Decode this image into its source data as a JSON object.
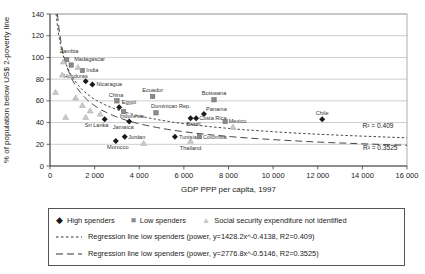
{
  "figure": {
    "background": "#ffffff"
  },
  "chart_data": {
    "type": "scatter",
    "title": "",
    "xlabel": "GDP PPP per capita, 1997",
    "ylabel": "% of population below US$ 2-poverty line",
    "xlim": [
      0,
      16000
    ],
    "ylim": [
      0,
      140
    ],
    "grid": "horizontal",
    "legend_position": "bottom-box",
    "xticks": [
      {
        "value": 0,
        "label": "0"
      },
      {
        "value": 2000,
        "label": "2 000"
      },
      {
        "value": 4000,
        "label": "4 000"
      },
      {
        "value": 6000,
        "label": "6 000"
      },
      {
        "value": 8000,
        "label": "8 000"
      },
      {
        "value": 10000,
        "label": "10 000"
      },
      {
        "value": 12000,
        "label": "12 000"
      },
      {
        "value": 14000,
        "label": "14 000"
      },
      {
        "value": 16000,
        "label": "16 000"
      }
    ],
    "yticks": [
      {
        "value": 0,
        "label": "0"
      },
      {
        "value": 20,
        "label": "20"
      },
      {
        "value": 40,
        "label": "40"
      },
      {
        "value": 60,
        "label": "60"
      },
      {
        "value": 80,
        "label": "80"
      },
      {
        "value": 100,
        "label": "100"
      },
      {
        "value": 120,
        "label": "120"
      },
      {
        "value": 140,
        "label": "140"
      }
    ],
    "series": [
      {
        "name": "High spenders",
        "marker": "diamond",
        "color": "#1a1a1a",
        "points": [
          {
            "label": "Honduras",
            "x": 1600,
            "y": 78,
            "anchor": "end",
            "dx": 2,
            "dy": -3
          },
          {
            "label": "Nicaragua",
            "x": 1900,
            "y": 75,
            "anchor": "start",
            "dx": 4,
            "dy": 1.5
          },
          {
            "label": "Egypt",
            "x": 3100,
            "y": 54,
            "anchor": "start",
            "dx": 2.5,
            "dy": -3.5
          },
          {
            "label": "Sri Lanka",
            "x": 2450,
            "y": 43,
            "anchor": "middle",
            "dx": -8,
            "dy": 8
          },
          {
            "label": "Jamaica",
            "x": 3550,
            "y": 41,
            "anchor": "middle",
            "dx": -6,
            "dy": 7.5
          },
          {
            "label": "Jordan",
            "x": 3350,
            "y": 27,
            "anchor": "start",
            "dx": 3.5,
            "dy": 2.5
          },
          {
            "label": "Morocco",
            "x": 2950,
            "y": 23,
            "anchor": "middle",
            "dx": 2,
            "dy": 8
          },
          {
            "label": "Tunisia",
            "x": 5600,
            "y": 27,
            "anchor": "start",
            "dx": 4,
            "dy": 2.5
          },
          {
            "label": "Brazil",
            "x": 6300,
            "y": 44,
            "anchor": "middle",
            "dx": 3,
            "dy": 8
          },
          {
            "label": "Costa Rica",
            "x": 6550,
            "y": 44,
            "anchor": "start",
            "dx": 3,
            "dy": 2
          },
          {
            "label": "Panama",
            "x": 6900,
            "y": 48,
            "anchor": "start",
            "dx": 2,
            "dy": -3
          },
          {
            "label": "Chile",
            "x": 12200,
            "y": 43,
            "anchor": "middle",
            "dx": 0,
            "dy": -4.5
          }
        ]
      },
      {
        "name": "Low spenders",
        "marker": "square",
        "color": "#8a8a8a",
        "stroke": "#666666",
        "points": [
          {
            "label": "Zambia",
            "x": 750,
            "y": 98,
            "anchor": "start",
            "dx": -7,
            "dy": -7
          },
          {
            "label": "Madagascar",
            "x": 950,
            "y": 93,
            "anchor": "start",
            "dx": 3,
            "dy": -4
          },
          {
            "label": "India",
            "x": 1450,
            "y": 88,
            "anchor": "start",
            "dx": 4,
            "dy": 1.5
          },
          {
            "label": "China",
            "x": 3000,
            "y": 60,
            "anchor": "middle",
            "dx": -1,
            "dy": -4
          },
          {
            "label": "Indonesia",
            "x": 3300,
            "y": 50,
            "anchor": "start",
            "dx": -4,
            "dy": 6.5
          },
          {
            "label": "Ecuador",
            "x": 4600,
            "y": 64,
            "anchor": "middle",
            "dx": 0,
            "dy": -4.5
          },
          {
            "label": "Dominican Rep.",
            "x": 4750,
            "y": 49,
            "anchor": "start",
            "dx": -5,
            "dy": -4.5
          },
          {
            "label": "Botswana",
            "x": 7350,
            "y": 61,
            "anchor": "middle",
            "dx": 0,
            "dy": -4.5
          },
          {
            "label": "Mexico",
            "x": 7850,
            "y": 41,
            "anchor": "start",
            "dx": 3.5,
            "dy": 1.5
          },
          {
            "label": "Colombia",
            "x": 6700,
            "y": 27,
            "anchor": "start",
            "dx": 3.5,
            "dy": 2
          }
        ]
      },
      {
        "name": "Social security expenditure not identified",
        "marker": "triangle",
        "color": "#c9c9c9",
        "stroke": "#a8a8a8",
        "points": [
          {
            "label": "Thailand",
            "x": 6300,
            "y": 23,
            "anchor": "middle",
            "dx": 0,
            "dy": 8.5
          },
          {
            "x": 250,
            "y": 68
          },
          {
            "x": 600,
            "y": 96
          },
          {
            "x": 1250,
            "y": 91
          },
          {
            "x": 550,
            "y": 84
          },
          {
            "x": 1150,
            "y": 63
          },
          {
            "x": 1450,
            "y": 56
          },
          {
            "x": 1800,
            "y": 51
          },
          {
            "x": 1600,
            "y": 45
          },
          {
            "x": 700,
            "y": 45
          },
          {
            "x": 2250,
            "y": 48
          },
          {
            "x": 4200,
            "y": 21
          },
          {
            "x": 8200,
            "y": 36
          }
        ]
      }
    ],
    "regressions": [
      {
        "name": "Regression line low spenders (power)",
        "a": 1428.2,
        "b": -0.4138,
        "r2": 0.409,
        "dash": "fine"
      },
      {
        "name": "Regression line low spenders (power)",
        "a": 2776.8,
        "b": -0.5146,
        "r2": 0.3525,
        "dash": "long"
      }
    ],
    "annotations": [
      {
        "text": "R² = 0.409",
        "x": 14700,
        "y": 35
      },
      {
        "text": "R² = 0.3525",
        "x": 14800,
        "y": 15
      }
    ]
  },
  "legend": {
    "items": [
      {
        "marker": "diamond",
        "label": "High spenders",
        "color": "#1a1a1a"
      },
      {
        "marker": "square",
        "label": "Low spenders",
        "color": "#8a8a8a"
      },
      {
        "marker": "triangle",
        "label": "Social security expenditure not identified",
        "color": "#c9c9c9"
      }
    ],
    "regression_lines": [
      {
        "dash": "fine",
        "label": "Regression line low spenders (power, y=1428.2x^-0.4138, R2=0.409)"
      },
      {
        "dash": "long",
        "label": "Regression line low spenders (power, y=2776.8x^-0.5146, R2=0.3525)"
      }
    ]
  }
}
